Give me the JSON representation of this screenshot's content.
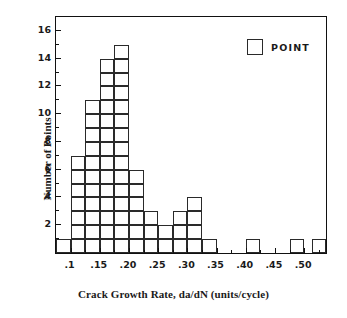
{
  "chart_data": {
    "type": "bar",
    "title": "",
    "subtitle": "",
    "xlabel": "Crack Growth Rate, da/dN  (units/cycle)",
    "ylabel": "Number of Points",
    "xlim": [
      0.075,
      0.5375
    ],
    "ylim": [
      0,
      17
    ],
    "bin_width": 0.025,
    "grid": false,
    "legend": {
      "position": "top-right",
      "entries": [
        {
          "label": "POINT",
          "marker": "open-square",
          "color": "#2a2a2a"
        }
      ]
    },
    "x_ticks": [
      {
        "value": 0.1,
        "label": ".1"
      },
      {
        "value": 0.15,
        "label": ".15"
      },
      {
        "value": 0.2,
        "label": ".20"
      },
      {
        "value": 0.25,
        "label": ".25"
      },
      {
        "value": 0.3,
        "label": ".30"
      },
      {
        "value": 0.35,
        "label": ".35"
      },
      {
        "value": 0.4,
        "label": ".40"
      },
      {
        "value": 0.45,
        "label": ".45"
      },
      {
        "value": 0.5,
        "label": ".50"
      }
    ],
    "x_minor_ticks": [
      0.125,
      0.175,
      0.225,
      0.275,
      0.325,
      0.375,
      0.425,
      0.475,
      0.525
    ],
    "y_ticks": [
      {
        "value": 2,
        "label": "2"
      },
      {
        "value": 4,
        "label": "4"
      },
      {
        "value": 6,
        "label": "6"
      },
      {
        "value": 8,
        "label": "8"
      },
      {
        "value": 10,
        "label": "10"
      },
      {
        "value": 12,
        "label": "12"
      },
      {
        "value": 14,
        "label": "14"
      },
      {
        "value": 16,
        "label": "16"
      }
    ],
    "y_minor_ticks": [
      1,
      3,
      5,
      7,
      9,
      11,
      13,
      15,
      17
    ],
    "bars": [
      {
        "bin_start": 0.075,
        "bin_end": 0.1,
        "value": 1
      },
      {
        "bin_start": 0.1,
        "bin_end": 0.125,
        "value": 7
      },
      {
        "bin_start": 0.125,
        "bin_end": 0.15,
        "value": 11
      },
      {
        "bin_start": 0.15,
        "bin_end": 0.175,
        "value": 14
      },
      {
        "bin_start": 0.175,
        "bin_end": 0.2,
        "value": 15
      },
      {
        "bin_start": 0.2,
        "bin_end": 0.225,
        "value": 6
      },
      {
        "bin_start": 0.225,
        "bin_end": 0.25,
        "value": 3
      },
      {
        "bin_start": 0.25,
        "bin_end": 0.275,
        "value": 2
      },
      {
        "bin_start": 0.275,
        "bin_end": 0.3,
        "value": 3
      },
      {
        "bin_start": 0.3,
        "bin_end": 0.325,
        "value": 4
      },
      {
        "bin_start": 0.325,
        "bin_end": 0.35,
        "value": 1
      },
      {
        "bin_start": 0.35,
        "bin_end": 0.375,
        "value": 0
      },
      {
        "bin_start": 0.375,
        "bin_end": 0.4,
        "value": 0
      },
      {
        "bin_start": 0.4,
        "bin_end": 0.425,
        "value": 1
      },
      {
        "bin_start": 0.425,
        "bin_end": 0.45,
        "value": 0
      },
      {
        "bin_start": 0.45,
        "bin_end": 0.475,
        "value": 0
      },
      {
        "bin_start": 0.475,
        "bin_end": 0.5,
        "value": 1
      },
      {
        "bin_start": 0.5,
        "bin_end": 0.513,
        "value": 0
      },
      {
        "bin_start": 0.513,
        "bin_end": 0.538,
        "value": 1
      }
    ],
    "categories": [
      ".075-.10",
      ".10-.125",
      ".125-.15",
      ".15-.175",
      ".175-.20",
      ".20-.225",
      ".225-.25",
      ".25-.275",
      ".275-.30",
      ".30-.325",
      ".325-.35",
      ".35-.375",
      ".375-.40",
      ".40-.425",
      ".425-.45",
      ".45-.475",
      ".475-.50",
      ".50-.513",
      ".513-.538"
    ],
    "values": [
      1,
      7,
      11,
      14,
      15,
      6,
      3,
      2,
      3,
      4,
      1,
      0,
      0,
      1,
      0,
      0,
      1,
      0,
      1
    ],
    "total_points": 70,
    "style": {
      "bar_fill": "none",
      "bar_stroke": "#2a2a2a",
      "axis_color": "#111111",
      "background": "#ffffff",
      "cell_stacked": true
    }
  }
}
